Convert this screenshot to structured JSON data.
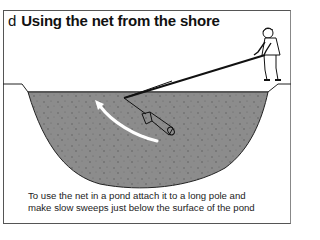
{
  "figure": {
    "label": "d",
    "title": "Using the net from the shore",
    "caption_lines": [
      "To use the net in a pond attach it to a long pole and",
      "make slow sweeps just below the surface of the pond"
    ],
    "colors": {
      "water": "#8a8a8a",
      "outline": "#222222",
      "arrow": "#ffffff",
      "frame": "#555555"
    },
    "illustration": {
      "elements": [
        "person-standing-on-bank",
        "long-pole",
        "pond-net",
        "sweep-arrow",
        "pond-cross-section"
      ]
    }
  }
}
